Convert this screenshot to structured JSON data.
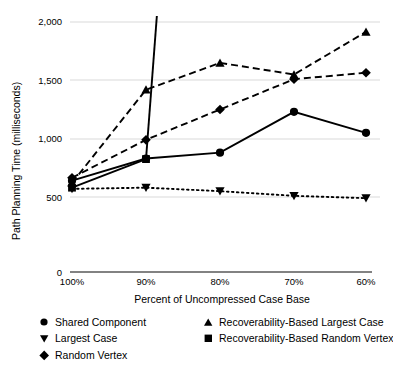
{
  "chart_data": {
    "type": "line",
    "title": "",
    "xlabel": "Percent of Uncompressed Case Base",
    "ylabel": "Path Planning Time (milliseconds)",
    "categories": [
      "100%",
      "90%",
      "80%",
      "70%",
      "60%"
    ],
    "x_tick_labels": [
      "100%",
      "90%",
      "80%",
      "70%",
      "60%"
    ],
    "y_tick_labels": [
      "0",
      "500",
      "1,000",
      "1,500",
      "2,000"
    ],
    "y_ticks": [
      0,
      500,
      1000,
      1500,
      2000
    ],
    "ylim": [
      0,
      2000
    ],
    "grid": "horizontal",
    "legend_position": "bottom",
    "series": [
      {
        "name": "Shared Component",
        "marker": "circle",
        "line_style": "solid",
        "values": [
          640,
          830,
          880,
          1230,
          1050
        ]
      },
      {
        "name": "Largest Case",
        "marker": "triangle-down",
        "line_style": "dotted",
        "values": [
          570,
          580,
          550,
          510,
          490
        ]
      },
      {
        "name": "Random Vertex",
        "marker": "diamond",
        "line_style": "dashed",
        "values": [
          665,
          990,
          1250,
          1510,
          1565
        ]
      },
      {
        "name": "Recoverability-Based Largest Case",
        "marker": "triangle-up",
        "line_style": "dashed",
        "values": [
          620,
          1420,
          1650,
          1550,
          1915
        ]
      },
      {
        "name": "Recoverability-Based Random Vertex",
        "marker": "square",
        "line_style": "solid",
        "values": [
          580,
          825,
          null,
          null,
          null
        ],
        "note": "rises off the top of the chart after 90%"
      }
    ]
  },
  "legend": {
    "items": [
      {
        "label": "Shared Component",
        "marker": "circle"
      },
      {
        "label": "Recoverability-Based Largest Case",
        "marker": "triangle-up"
      },
      {
        "label": "Largest Case",
        "marker": "triangle-down"
      },
      {
        "label": "Recoverability-Based Random Vertex",
        "marker": "square"
      },
      {
        "label": "Random Vertex",
        "marker": "diamond"
      }
    ]
  },
  "colors": {
    "ink": "#000000",
    "grid": "#d9d9d9",
    "axis": "#595959",
    "background": "#ffffff"
  }
}
